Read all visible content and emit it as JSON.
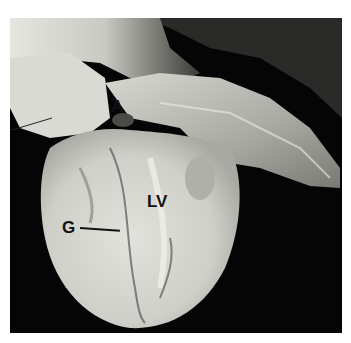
{
  "figure": {
    "labels": {
      "a": "A",
      "lv": "LV",
      "g": "G"
    },
    "colors": {
      "background": "#050505",
      "tissue_light": "#dcdcd6",
      "tissue_mid": "#b8b8b2",
      "tissue_dark": "#7a7a74",
      "label": "#111111"
    }
  }
}
